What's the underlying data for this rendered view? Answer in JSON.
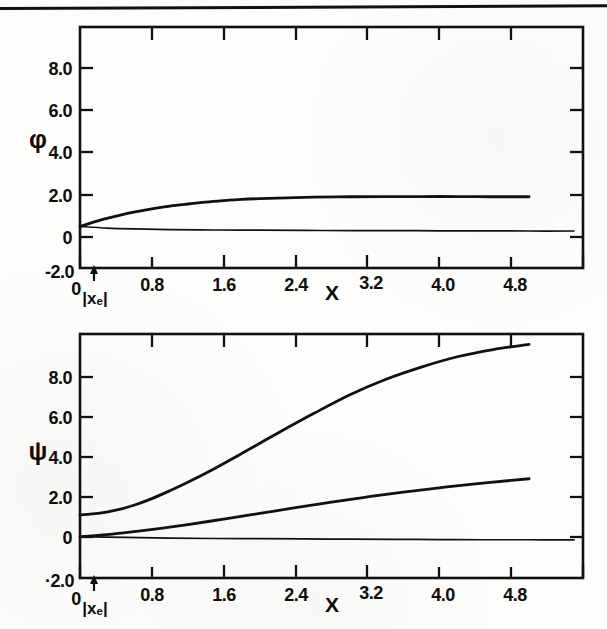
{
  "figure": {
    "ink_color": "#0d0d0d",
    "paper_color": "#fdfdfc",
    "header_rule": "horizontal-rule"
  },
  "chart_data": [
    {
      "type": "line",
      "id": "phi-plot",
      "title": "",
      "xlabel": "X",
      "ylabel": "φ",
      "xlim": [
        0,
        5.6
      ],
      "ylim": [
        -2.0,
        9.6
      ],
      "grid": false,
      "legend": "none",
      "xticks": [
        0,
        0.8,
        1.6,
        2.4,
        3.2,
        4.0,
        4.8
      ],
      "xticklabels": [
        "0",
        "0.8",
        "1.6",
        "2.4",
        "3.2",
        "4.0",
        "4.8"
      ],
      "xminorticks": [
        0.4,
        1.2,
        2.0,
        2.8,
        3.6,
        4.4,
        5.2
      ],
      "yticks": [
        -2.0,
        0,
        2.0,
        4.0,
        6.0,
        8.0
      ],
      "yticklabels": [
        "-2.0",
        "0",
        "2.0",
        "4.0",
        "6.0",
        "8.0"
      ],
      "annotations": [
        {
          "text": "|xₑ|",
          "x": 0.15,
          "y": -2.0,
          "marker": "up-arrow"
        }
      ],
      "series": [
        {
          "name": "phi-upper",
          "x": [
            0.0,
            0.1,
            0.2,
            0.3,
            0.45,
            0.6,
            0.8,
            1.0,
            1.2,
            1.4,
            1.6,
            1.8,
            2.0,
            2.3,
            2.6,
            3.0,
            3.4,
            3.8,
            4.2,
            4.6,
            5.0
          ],
          "y": [
            0.0,
            0.14,
            0.27,
            0.39,
            0.55,
            0.69,
            0.85,
            0.98,
            1.08,
            1.17,
            1.24,
            1.3,
            1.34,
            1.38,
            1.41,
            1.43,
            1.44,
            1.44,
            1.44,
            1.43,
            1.43
          ]
        },
        {
          "name": "phi-lower",
          "x": [
            0.0,
            0.3,
            0.6,
            1.0,
            1.5,
            2.0,
            2.5,
            3.0,
            3.5,
            4.0,
            4.5,
            5.0,
            5.5
          ],
          "y": [
            0.0,
            -0.08,
            -0.12,
            -0.15,
            -0.17,
            -0.18,
            -0.19,
            -0.2,
            -0.2,
            -0.21,
            -0.21,
            -0.22,
            -0.22
          ]
        }
      ]
    },
    {
      "type": "line",
      "id": "psi-plot",
      "title": "",
      "xlabel": "X",
      "ylabel": "ψ",
      "xlim": [
        0,
        5.6
      ],
      "ylim": [
        -2.0,
        9.8
      ],
      "grid": false,
      "legend": "none",
      "xticks": [
        0,
        0.8,
        1.6,
        2.4,
        3.2,
        4.0,
        4.8
      ],
      "xticklabels": [
        "0",
        "0.8",
        "1.6",
        "2.4",
        "3.2",
        "4.0",
        "4.8"
      ],
      "xminorticks": [
        0.4,
        1.2,
        2.0,
        2.8,
        3.6,
        4.4,
        5.2
      ],
      "yticks": [
        -2.0,
        0,
        2.0,
        4.0,
        6.0,
        8.0
      ],
      "yticklabels": [
        "·2.0",
        "0",
        "2.0",
        "4.0",
        "6.0",
        "8.0"
      ],
      "annotations": [
        {
          "text": "|xₑ|",
          "x": 0.15,
          "y": -2.0,
          "marker": "up-arrow"
        }
      ],
      "series": [
        {
          "name": "psi-upper",
          "x": [
            0.0,
            0.2,
            0.4,
            0.6,
            0.8,
            1.0,
            1.2,
            1.5,
            1.8,
            2.2,
            2.6,
            3.0,
            3.4,
            3.8,
            4.2,
            4.6,
            5.0
          ],
          "y": [
            1.05,
            1.12,
            1.28,
            1.52,
            1.84,
            2.22,
            2.63,
            3.3,
            4.02,
            5.0,
            5.95,
            6.85,
            7.6,
            8.2,
            8.7,
            9.05,
            9.3
          ]
        },
        {
          "name": "psi-middle",
          "x": [
            0.0,
            0.3,
            0.6,
            0.9,
            1.2,
            1.6,
            2.0,
            2.4,
            2.8,
            3.2,
            3.6,
            4.0,
            4.4,
            4.8,
            5.0
          ],
          "y": [
            0.0,
            0.1,
            0.24,
            0.4,
            0.58,
            0.85,
            1.12,
            1.4,
            1.67,
            1.92,
            2.15,
            2.36,
            2.55,
            2.72,
            2.8
          ]
        },
        {
          "name": "psi-baseline",
          "x": [
            0.0,
            0.5,
            1.0,
            1.5,
            2.0,
            2.5,
            3.0,
            3.5,
            4.0,
            4.5,
            5.0,
            5.5
          ],
          "y": [
            0.0,
            -0.04,
            -0.07,
            -0.09,
            -0.1,
            -0.11,
            -0.12,
            -0.13,
            -0.14,
            -0.15,
            -0.15,
            -0.16
          ]
        }
      ]
    }
  ]
}
